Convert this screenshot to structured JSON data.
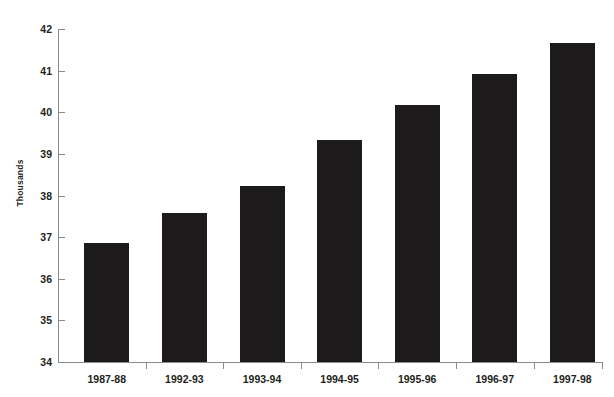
{
  "chart_data": {
    "type": "bar",
    "title": "",
    "subtitle": "",
    "xlabel": "",
    "ylabel": "Thousands",
    "categories": [
      "1987-88",
      "1992-93",
      "1993-94",
      "1994-95",
      "1995-96",
      "1996-97",
      "1997-98"
    ],
    "values": [
      36.85,
      37.58,
      38.23,
      39.33,
      40.17,
      40.93,
      41.67
    ],
    "ylim": [
      34,
      42
    ],
    "yticks": [
      34,
      35,
      36,
      37,
      38,
      39,
      40,
      41,
      42
    ],
    "ytick_labels": [
      "34",
      "35",
      "36",
      "37",
      "38",
      "39",
      "40",
      "41",
      "42"
    ],
    "grid": false,
    "legend": null,
    "legend_position": "none",
    "series": [
      {
        "name": "Thousands",
        "values": [
          36.85,
          37.58,
          38.23,
          39.33,
          40.17,
          40.93,
          41.67
        ]
      }
    ],
    "bar_color": "#1c1a1a",
    "axis_color": "#8a8a8a",
    "text_color": "#231f20",
    "background_color": "#ffffff"
  }
}
